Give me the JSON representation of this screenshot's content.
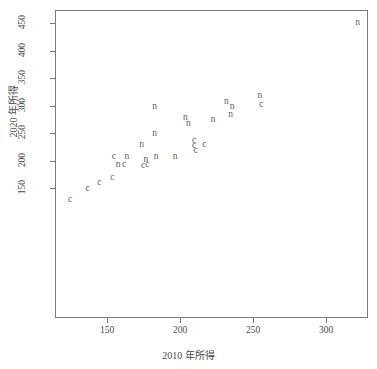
{
  "chart_data": {
    "type": "scatter",
    "title": "",
    "xlabel": "2010 年所得",
    "ylabel": "2020 年所得",
    "xlim": [
      120,
      330
    ],
    "ylim": [
      125,
      462
    ],
    "grid": false,
    "legend_position": "none",
    "xticks": [
      150,
      200,
      250,
      300
    ],
    "yticks": [
      150,
      200,
      250,
      300,
      350,
      400,
      450
    ],
    "point_labels": [
      "c",
      "n"
    ],
    "series": [
      {
        "name": "c",
        "marker_text": "c",
        "points": [
          {
            "label": "c",
            "x": 124,
            "y": 130
          },
          {
            "label": "c",
            "x": 136,
            "y": 150
          },
          {
            "label": "c",
            "x": 144,
            "y": 161
          },
          {
            "label": "c",
            "x": 153,
            "y": 170
          },
          {
            "label": "c",
            "x": 154,
            "y": 208
          },
          {
            "label": "c",
            "x": 161,
            "y": 193
          },
          {
            "label": "c",
            "x": 174,
            "y": 191
          },
          {
            "label": "c",
            "x": 177,
            "y": 194
          },
          {
            "label": "c",
            "x": 209,
            "y": 237
          },
          {
            "label": "c",
            "x": 209,
            "y": 228
          },
          {
            "label": "c",
            "x": 216,
            "y": 230
          },
          {
            "label": "c",
            "x": 210,
            "y": 220
          },
          {
            "label": "c",
            "x": 255,
            "y": 302
          }
        ]
      },
      {
        "name": "n",
        "marker_text": "n",
        "points": [
          {
            "label": "n",
            "x": 157,
            "y": 194
          },
          {
            "label": "n",
            "x": 163,
            "y": 208
          },
          {
            "label": "n",
            "x": 173,
            "y": 230
          },
          {
            "label": "n",
            "x": 176,
            "y": 203
          },
          {
            "label": "n",
            "x": 182,
            "y": 300
          },
          {
            "label": "n",
            "x": 182,
            "y": 250
          },
          {
            "label": "n",
            "x": 183,
            "y": 208
          },
          {
            "label": "n",
            "x": 196,
            "y": 208
          },
          {
            "label": "n",
            "x": 203,
            "y": 279
          },
          {
            "label": "n",
            "x": 205,
            "y": 268
          },
          {
            "label": "n",
            "x": 222,
            "y": 275
          },
          {
            "label": "n",
            "x": 231,
            "y": 308
          },
          {
            "label": "n",
            "x": 235,
            "y": 300
          },
          {
            "label": "n",
            "x": 234,
            "y": 285
          },
          {
            "label": "n",
            "x": 254,
            "y": 319
          },
          {
            "label": "n",
            "x": 321,
            "y": 452
          }
        ]
      }
    ]
  },
  "axes": {
    "x_label": "2010 年所得",
    "y_label": "2020 年所得",
    "x_tick_labels": [
      "150",
      "200",
      "250",
      "300"
    ],
    "y_tick_labels": [
      "150",
      "200",
      "250",
      "300",
      "350",
      "400",
      "450"
    ]
  },
  "style": {
    "frame_color": "#7a7a7a",
    "text_color": "#4a4a4a",
    "marker_color": "#5c5c5c",
    "background": "#ffffff"
  }
}
